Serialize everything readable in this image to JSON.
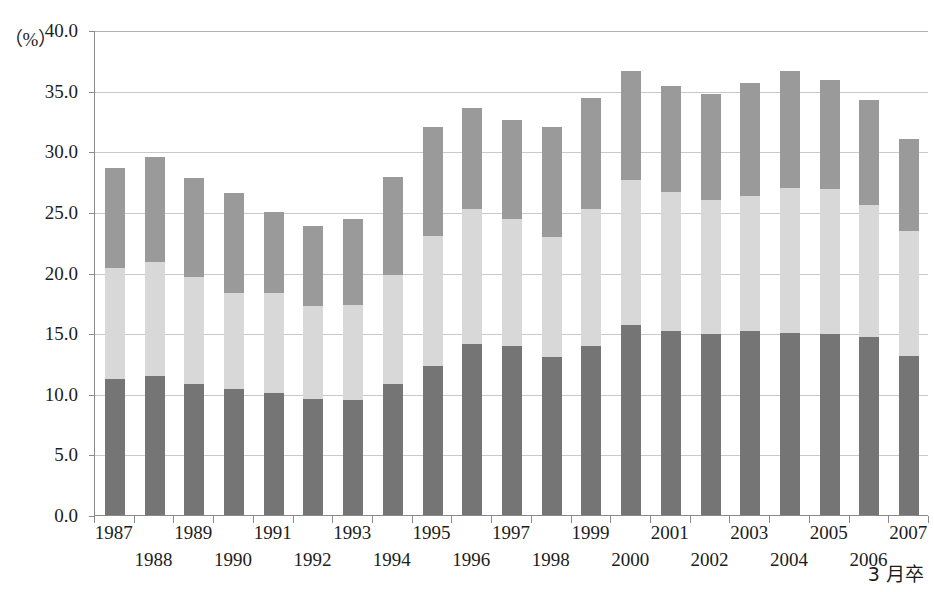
{
  "chart_data": {
    "type": "bar",
    "stacked": true,
    "title": "",
    "subtitle": "",
    "xlabel": "",
    "ylabel": "",
    "unit_label": "（%）",
    "corner_note": "3 月卒",
    "ylim": [
      0.0,
      40.0
    ],
    "ytick_step": 5.0,
    "ytick_labels": [
      "40.0",
      "35.0",
      "30.0",
      "25.0",
      "20.0",
      "15.0",
      "10.0",
      "5.0",
      "0.0"
    ],
    "ytick_values": [
      40.0,
      35.0,
      30.0,
      25.0,
      20.0,
      15.0,
      10.0,
      5.0,
      0.0
    ],
    "grid": true,
    "legend": "none",
    "categories": [
      "1987",
      "1988",
      "1989",
      "1990",
      "1991",
      "1992",
      "1993",
      "1994",
      "1995",
      "1996",
      "1997",
      "1998",
      "1999",
      "2000",
      "2001",
      "2002",
      "2003",
      "2004",
      "2005",
      "2006",
      "2007"
    ],
    "series": [
      {
        "name": "bottom",
        "color": "#757575",
        "values": [
          11.2,
          11.5,
          10.8,
          10.4,
          10.1,
          9.6,
          9.5,
          10.8,
          12.3,
          14.1,
          13.9,
          13.0,
          13.9,
          15.7,
          15.2,
          14.9,
          15.2,
          15.0,
          14.9,
          14.7,
          13.1
        ]
      },
      {
        "name": "middle",
        "color": "#d8d8d8",
        "values": [
          9.2,
          9.4,
          8.8,
          7.9,
          8.2,
          7.6,
          7.8,
          9.0,
          10.7,
          11.1,
          10.5,
          9.9,
          11.3,
          11.9,
          11.4,
          11.1,
          11.1,
          12.0,
          12.0,
          10.9,
          10.3
        ]
      },
      {
        "name": "top",
        "color": "#9a9a9a",
        "values": [
          8.2,
          8.6,
          8.2,
          8.3,
          6.7,
          6.6,
          7.1,
          8.1,
          9.0,
          8.4,
          8.2,
          9.1,
          9.2,
          9.0,
          8.8,
          8.7,
          9.3,
          9.6,
          9.0,
          8.6,
          7.6
        ]
      }
    ],
    "totals": [
      28.6,
      29.5,
      27.8,
      26.6,
      25.0,
      23.8,
      24.4,
      27.9,
      32.0,
      33.6,
      32.6,
      32.0,
      34.4,
      36.6,
      35.4,
      34.7,
      35.6,
      36.6,
      35.9,
      34.2,
      31.0
    ]
  },
  "colors": {
    "segment_bottom": "#757575",
    "segment_middle": "#d8d8d8",
    "segment_top": "#9a9a9a",
    "axis": "#8a8a8a",
    "grid": "#c9c9c9",
    "text": "#1c1c1c",
    "background": "#ffffff"
  }
}
